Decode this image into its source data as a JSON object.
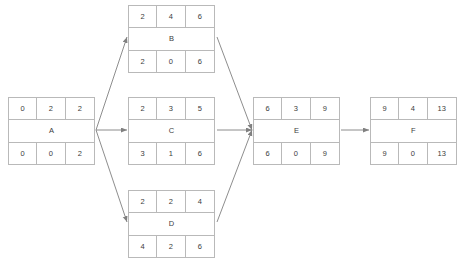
{
  "diagram": {
    "type": "activity-on-node-network",
    "colors": {
      "background": "#ffffff",
      "border": "#b9b9b9",
      "text": "#3c3c3c",
      "edge": "#808080"
    },
    "nodes": [
      {
        "id": "A",
        "label": "A",
        "top": [
          "0",
          "2",
          "2"
        ],
        "bottom": [
          "0",
          "0",
          "2"
        ],
        "x": 8,
        "y": 97
      },
      {
        "id": "B",
        "label": "B",
        "top": [
          "2",
          "4",
          "6"
        ],
        "bottom": [
          "2",
          "0",
          "6"
        ],
        "x": 128,
        "y": 5
      },
      {
        "id": "C",
        "label": "C",
        "top": [
          "2",
          "3",
          "5"
        ],
        "bottom": [
          "3",
          "1",
          "6"
        ],
        "x": 128,
        "y": 97
      },
      {
        "id": "D",
        "label": "D",
        "top": [
          "2",
          "2",
          "4"
        ],
        "bottom": [
          "4",
          "2",
          "6"
        ],
        "x": 128,
        "y": 190
      },
      {
        "id": "E",
        "label": "E",
        "top": [
          "6",
          "3",
          "9"
        ],
        "bottom": [
          "6",
          "0",
          "9"
        ],
        "x": 253,
        "y": 97
      },
      {
        "id": "F",
        "label": "F",
        "top": [
          "9",
          "4",
          "13"
        ],
        "bottom": [
          "9",
          "0",
          "13"
        ],
        "x": 370,
        "y": 97
      }
    ],
    "edges": [
      {
        "from": "A",
        "to": "B",
        "x1": 96,
        "y1": 130,
        "x2": 127,
        "y2": 37
      },
      {
        "from": "A",
        "to": "C",
        "x1": 96,
        "y1": 130,
        "x2": 127,
        "y2": 130
      },
      {
        "from": "A",
        "to": "D",
        "x1": 96,
        "y1": 130,
        "x2": 127,
        "y2": 222
      },
      {
        "from": "B",
        "to": "E",
        "x1": 217,
        "y1": 37,
        "x2": 252,
        "y2": 130
      },
      {
        "from": "C",
        "to": "E",
        "x1": 217,
        "y1": 130,
        "x2": 252,
        "y2": 130
      },
      {
        "from": "D",
        "to": "E",
        "x1": 217,
        "y1": 222,
        "x2": 252,
        "y2": 130
      },
      {
        "from": "E",
        "to": "F",
        "x1": 341,
        "y1": 130,
        "x2": 369,
        "y2": 130
      }
    ]
  }
}
